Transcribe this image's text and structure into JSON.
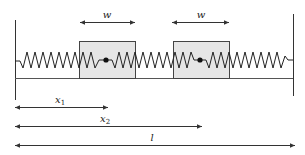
{
  "diagram": {
    "colors": {
      "line": "#333333",
      "box_fill": "#e6e6e6",
      "box_stroke": "#444444",
      "background": "#ffffff"
    },
    "labels": {
      "width_left": "w",
      "width_right": "w",
      "x1": "x",
      "x1_sub": "1",
      "x2": "x",
      "x2_sub": "2",
      "length": "l"
    },
    "elements": {
      "walls": [
        "left-wall",
        "right-wall"
      ],
      "masses": [
        "mass-1",
        "mass-2"
      ],
      "springs": 3,
      "dimension_arrows": [
        "w",
        "w",
        "x1",
        "x2",
        "l"
      ]
    }
  }
}
